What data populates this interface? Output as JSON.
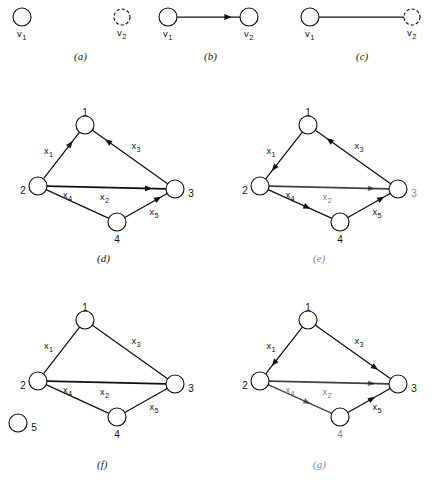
{
  "figure": {
    "caption_style": "parenthesized-italic-letters",
    "vertex_label_v1": "v",
    "vertex_label_v1_sub": "1",
    "vertex_label_v2": "v",
    "vertex_label_v2_sub": "2",
    "edge_label_prefix": "x"
  },
  "panels": [
    {
      "id": "a",
      "caption": "(a)",
      "type": "two isolated vertices",
      "directed": false,
      "nodes": [
        {
          "name": "v1",
          "label": "v",
          "sub": "1",
          "x": 22,
          "y": 17,
          "r": 9,
          "style": "solid"
        },
        {
          "name": "v2",
          "label": "v",
          "sub": "2",
          "x": 122,
          "y": 17,
          "r": 8,
          "style": "dashed"
        }
      ],
      "edges": []
    },
    {
      "id": "b",
      "caption": "(b)",
      "type": "directed edge",
      "directed": true,
      "nodes": [
        {
          "name": "v1",
          "label": "v",
          "sub": "1",
          "x": 168,
          "y": 17,
          "r": 9,
          "style": "solid"
        },
        {
          "name": "v2",
          "label": "v",
          "sub": "2",
          "x": 249,
          "y": 17,
          "r": 9,
          "style": "solid"
        }
      ],
      "edges": [
        {
          "name": "v1-v2",
          "from": "v1",
          "to": "v2",
          "label": "",
          "sub": "",
          "arrow": "forward",
          "arrow_pos": 0.82
        }
      ]
    },
    {
      "id": "c",
      "caption": "(c)",
      "type": "undirected edge",
      "directed": false,
      "nodes": [
        {
          "name": "v1",
          "label": "v",
          "sub": "1",
          "x": 310,
          "y": 17,
          "r": 9,
          "style": "solid"
        },
        {
          "name": "v2",
          "label": "v",
          "sub": "2",
          "x": 412,
          "y": 17,
          "r": 8,
          "style": "dashed"
        }
      ],
      "edges": [
        {
          "name": "v1-v2",
          "from": "v1",
          "to": "v2",
          "label": "",
          "sub": "",
          "arrow": "none",
          "arrow_pos": 0.5
        }
      ]
    },
    {
      "id": "d",
      "caption": "(d)",
      "type": "directed graph four vertices",
      "directed": true,
      "nodes": [
        {
          "name": "n1",
          "label": "1",
          "x": 85,
          "y": 125,
          "r": 9,
          "label_dx": 0,
          "label_dy": -13
        },
        {
          "name": "n2",
          "label": "2",
          "x": 38,
          "y": 186,
          "r": 9,
          "label_dx": -15,
          "label_dy": 4
        },
        {
          "name": "n3",
          "label": "3",
          "x": 175,
          "y": 189,
          "r": 9,
          "label_dx": 16,
          "label_dy": 4
        },
        {
          "name": "n4",
          "label": "4",
          "x": 117,
          "y": 222,
          "r": 9,
          "label_dx": 0,
          "label_dy": 17
        }
      ],
      "edges": [
        {
          "name": "x1",
          "from": "n2",
          "to": "n1",
          "label": "x",
          "sub": "1",
          "arrow": "forward",
          "arrow_pos": 0.76,
          "label_dx": -13,
          "label_dy": -2
        },
        {
          "name": "x3",
          "from": "n3",
          "to": "n1",
          "label": "x",
          "sub": "3",
          "arrow": "forward",
          "arrow_pos": 0.8,
          "label_dx": 6,
          "label_dy": -8
        },
        {
          "name": "x2",
          "from": "n2",
          "to": "n3",
          "label": "x",
          "sub": "2",
          "arrow": "forward",
          "arrow_pos": 0.86,
          "label_dx": -2,
          "label_dy": 12
        },
        {
          "name": "x4",
          "from": "n2",
          "to": "n4",
          "label": "x",
          "sub": "4",
          "arrow": "none",
          "arrow_pos": 0.55,
          "label_dx": -10,
          "label_dy": -6
        },
        {
          "name": "x5",
          "from": "n4",
          "to": "n3",
          "label": "x",
          "sub": "5",
          "arrow": "forward",
          "arrow_pos": 0.8,
          "label_dx": 8,
          "label_dy": 9
        }
      ]
    },
    {
      "id": "e",
      "caption": "(e)",
      "type": "directed graph four vertices",
      "directed": true,
      "nodes": [
        {
          "name": "n1",
          "label": "1",
          "x": 308,
          "y": 125,
          "r": 9,
          "label_dx": 0,
          "label_dy": -13
        },
        {
          "name": "n2",
          "label": "2",
          "x": 260,
          "y": 186,
          "r": 9,
          "label_dx": -15,
          "label_dy": 4
        },
        {
          "name": "n3",
          "label": "3",
          "x": 398,
          "y": 189,
          "r": 9,
          "label_dx": 16,
          "label_dy": 4,
          "faded": true
        },
        {
          "name": "n4",
          "label": "4",
          "x": 340,
          "y": 222,
          "r": 9,
          "label_dx": 0,
          "label_dy": 17
        }
      ],
      "edges": [
        {
          "name": "x1",
          "from": "n1",
          "to": "n2",
          "label": "x",
          "sub": "1",
          "arrow": "forward",
          "arrow_pos": 0.78,
          "label_dx": -13,
          "label_dy": -2
        },
        {
          "name": "x3",
          "from": "n3",
          "to": "n1",
          "label": "x",
          "sub": "3",
          "arrow": "forward",
          "arrow_pos": 0.82,
          "label_dx": 6,
          "label_dy": -8
        },
        {
          "name": "x2",
          "from": "n2",
          "to": "n3",
          "label": "x",
          "sub": "2",
          "arrow": "forward",
          "arrow_pos": 0.86,
          "label_dx": -2,
          "label_dy": 12,
          "faded": true
        },
        {
          "name": "x4",
          "from": "n2",
          "to": "n4",
          "label": "x",
          "sub": "4",
          "arrow": "forward",
          "arrow_pos": 0.62,
          "label_dx": -10,
          "label_dy": -6
        },
        {
          "name": "x5",
          "from": "n4",
          "to": "n3",
          "label": "x",
          "sub": "5",
          "arrow": "forward",
          "arrow_pos": 0.8,
          "label_dx": 8,
          "label_dy": 9
        }
      ]
    },
    {
      "id": "f",
      "caption": "(f)",
      "type": "undirected graph with isolated vertex",
      "directed": false,
      "nodes": [
        {
          "name": "n1",
          "label": "1",
          "x": 85,
          "y": 320,
          "r": 9,
          "label_dx": 0,
          "label_dy": -13
        },
        {
          "name": "n2",
          "label": "2",
          "x": 38,
          "y": 381,
          "r": 9,
          "label_dx": -15,
          "label_dy": 4
        },
        {
          "name": "n3",
          "label": "3",
          "x": 175,
          "y": 384,
          "r": 9,
          "label_dx": 16,
          "label_dy": 4
        },
        {
          "name": "n4",
          "label": "4",
          "x": 117,
          "y": 417,
          "r": 9,
          "label_dx": 0,
          "label_dy": 17
        },
        {
          "name": "n5",
          "label": "5",
          "x": 18,
          "y": 423,
          "r": 9,
          "label_dx": 16,
          "label_dy": 4,
          "isolated": true
        }
      ],
      "edges": [
        {
          "name": "x1",
          "from": "n2",
          "to": "n1",
          "label": "x",
          "sub": "1",
          "arrow": "none",
          "arrow_pos": 0.5,
          "label_dx": -13,
          "label_dy": -2
        },
        {
          "name": "x3",
          "from": "n1",
          "to": "n3",
          "label": "x",
          "sub": "3",
          "arrow": "none",
          "arrow_pos": 0.5,
          "label_dx": 6,
          "label_dy": -8
        },
        {
          "name": "x2",
          "from": "n2",
          "to": "n3",
          "label": "x",
          "sub": "2",
          "arrow": "none",
          "arrow_pos": 0.5,
          "label_dx": -2,
          "label_dy": 12
        },
        {
          "name": "x4",
          "from": "n2",
          "to": "n4",
          "label": "x",
          "sub": "4",
          "arrow": "none",
          "arrow_pos": 0.5,
          "label_dx": -10,
          "label_dy": -6
        },
        {
          "name": "x5",
          "from": "n4",
          "to": "n3",
          "label": "x",
          "sub": "5",
          "arrow": "none",
          "arrow_pos": 0.5,
          "label_dx": 8,
          "label_dy": 9
        }
      ]
    },
    {
      "id": "g",
      "caption": "(g)",
      "type": "directed graph four vertices",
      "directed": true,
      "nodes": [
        {
          "name": "n1",
          "label": "1",
          "x": 308,
          "y": 320,
          "r": 9,
          "label_dx": 0,
          "label_dy": -13
        },
        {
          "name": "n2",
          "label": "2",
          "x": 260,
          "y": 381,
          "r": 9,
          "label_dx": -15,
          "label_dy": 4
        },
        {
          "name": "n3",
          "label": "3",
          "x": 398,
          "y": 384,
          "r": 9,
          "label_dx": 16,
          "label_dy": 4
        },
        {
          "name": "n4",
          "label": "4",
          "x": 340,
          "y": 417,
          "r": 9,
          "label_dx": 0,
          "label_dy": 17,
          "faded": true
        }
      ],
      "edges": [
        {
          "name": "x1",
          "from": "n1",
          "to": "n2",
          "label": "x",
          "sub": "1",
          "arrow": "forward",
          "arrow_pos": 0.78,
          "label_dx": -13,
          "label_dy": -2
        },
        {
          "name": "x3",
          "from": "n1",
          "to": "n3",
          "label": "x",
          "sub": "3",
          "arrow": "forward",
          "arrow_pos": 0.8,
          "label_dx": 6,
          "label_dy": -8
        },
        {
          "name": "x2",
          "from": "n2",
          "to": "n3",
          "label": "x",
          "sub": "2",
          "arrow": "forward",
          "arrow_pos": 0.86,
          "label_dx": -2,
          "label_dy": 12,
          "faded": true
        },
        {
          "name": "x4",
          "from": "n2",
          "to": "n4",
          "label": "x",
          "sub": "4",
          "arrow": "forward",
          "arrow_pos": 0.62,
          "label_dx": -10,
          "label_dy": -6,
          "faded": true
        },
        {
          "name": "x5",
          "from": "n3",
          "to": "n4",
          "label": "x",
          "sub": "5",
          "arrow": "backward",
          "arrow_pos": 0.42,
          "label_dx": 8,
          "label_dy": 9
        }
      ]
    }
  ],
  "captions": [
    {
      "name": "caption-a",
      "text": "(a)",
      "x": 74,
      "y": 50,
      "faded": false
    },
    {
      "name": "caption-b",
      "text": "(b)",
      "x": 204,
      "y": 50,
      "faded": false
    },
    {
      "name": "caption-c",
      "text": "(c)",
      "x": 356,
      "y": 50,
      "faded": false
    },
    {
      "name": "caption-d",
      "text": "(d)",
      "x": 97,
      "y": 252,
      "faded": false
    },
    {
      "name": "caption-e",
      "text": "(e)",
      "x": 313,
      "y": 252,
      "faded": true
    },
    {
      "name": "caption-f",
      "text": "(f)",
      "x": 97,
      "y": 458,
      "faded": false
    },
    {
      "name": "caption-g",
      "text": "(g)",
      "x": 313,
      "y": 458,
      "faded": true
    }
  ]
}
